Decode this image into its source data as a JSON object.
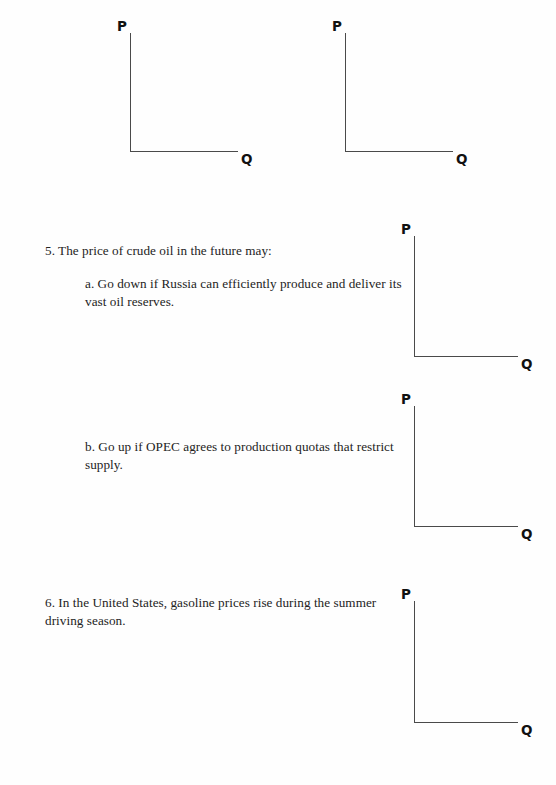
{
  "document": {
    "type": "economics-worksheet",
    "background_color": "#fefefe",
    "text_color": "#232323",
    "axis_color": "#4a4a4a"
  },
  "axis_labels": {
    "price": "P",
    "quantity": "Q"
  },
  "diagrams": [
    {
      "id": "diagram-top-left",
      "price_label": "P",
      "quantity_label": "Q"
    },
    {
      "id": "diagram-top-right",
      "price_label": "P",
      "quantity_label": "Q"
    },
    {
      "id": "diagram-q5a",
      "price_label": "P",
      "quantity_label": "Q"
    },
    {
      "id": "diagram-q5b",
      "price_label": "P",
      "quantity_label": "Q"
    },
    {
      "id": "diagram-q6",
      "price_label": "P",
      "quantity_label": "Q"
    }
  ],
  "questions": [
    {
      "number": "5",
      "text": "5. The price of crude oil in the future may:",
      "subitems": [
        {
          "letter": "a",
          "text": "a. Go down if Russia can efficiently produce and deliver its vast oil reserves."
        },
        {
          "letter": "b",
          "text": "b. Go up if OPEC agrees to production quotas that restrict supply."
        }
      ]
    },
    {
      "number": "6",
      "text": "6. In the United States, gasoline prices rise during the summer driving season.",
      "subitems": []
    }
  ]
}
